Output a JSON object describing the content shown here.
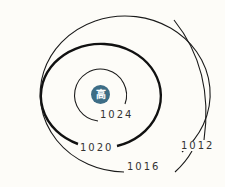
{
  "map": {
    "type": "isobar-chart",
    "center": {
      "label": "高",
      "meaning": "high pressure",
      "color": "#3d6d86"
    },
    "isobars": [
      {
        "value": "1024",
        "unit": "hPa"
      },
      {
        "value": "1020",
        "unit": "hPa",
        "emphasis": "bold"
      },
      {
        "value": "1016",
        "unit": "hPa"
      },
      {
        "value": "1012",
        "unit": "hPa"
      }
    ],
    "line_color": "#1a1a1a",
    "background": "#fdfcf8"
  }
}
